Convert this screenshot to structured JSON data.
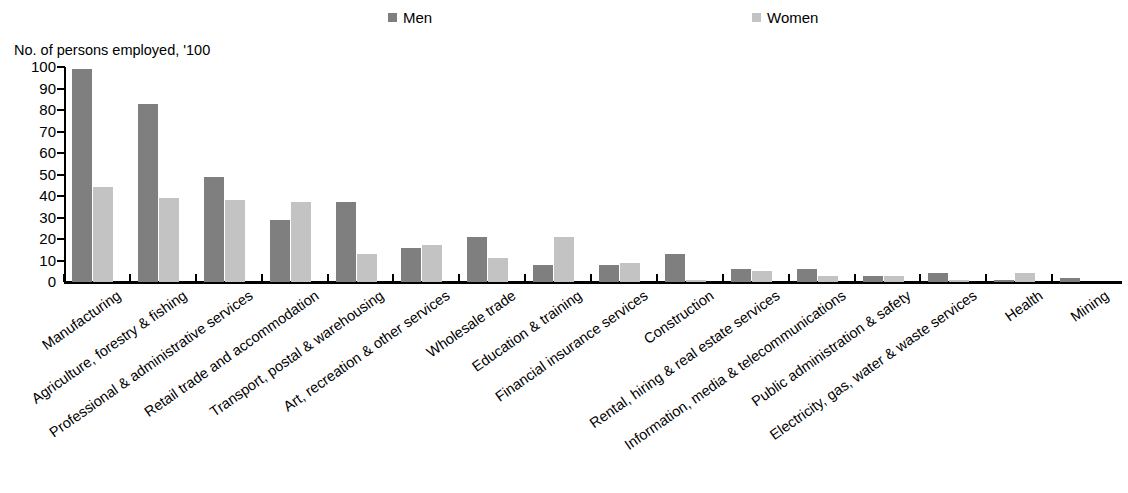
{
  "legend": {
    "items": [
      {
        "label": "Men",
        "color": "#7f7f7f"
      },
      {
        "label": "Women",
        "color": "#c3c3c3"
      }
    ]
  },
  "axis_title": "No. of persons employed, '100",
  "chart_data": {
    "type": "bar",
    "title": "",
    "subtitle": "",
    "xlabel": "",
    "ylabel": "No. of persons employed, '100",
    "ylim": [
      0,
      100
    ],
    "yticks": [
      0,
      10,
      20,
      30,
      40,
      50,
      60,
      70,
      80,
      90,
      100
    ],
    "grid": false,
    "legend_position": "top",
    "categories": [
      "Manufacturing",
      "Agriculture, forestry & fishing",
      "Professional & administrative services",
      "Retail trade and accommodation",
      "Transport, postal & warehousing",
      "Art, recreation & other services",
      "Wholesale trade",
      "Education & training",
      "Financial insurance services",
      "Construction",
      "Rental, hiring & real estate services",
      "Information, media & telecommunications",
      "Public administration & safety",
      "Electricity, gas, water & waste services",
      "Health",
      "Mining"
    ],
    "series": [
      {
        "name": "Men",
        "color": "#7f7f7f",
        "values": [
          99,
          83,
          49,
          29,
          37,
          16,
          21,
          8,
          8,
          13,
          6,
          6,
          3,
          4,
          1,
          2
        ]
      },
      {
        "name": "Women",
        "color": "#c3c3c3",
        "values": [
          44,
          39,
          38,
          37,
          13,
          17,
          11,
          21,
          9,
          1,
          5,
          3,
          3,
          1,
          4,
          0
        ]
      }
    ]
  }
}
